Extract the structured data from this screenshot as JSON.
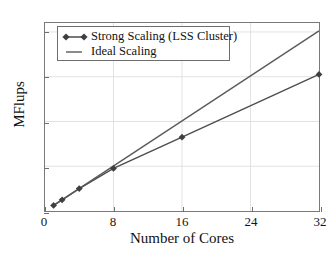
{
  "chart_data": {
    "type": "line",
    "title": "",
    "xlabel": "Number of Cores",
    "ylabel": "MFlups",
    "xlim": [
      0,
      32
    ],
    "ylim": [
      0,
      84
    ],
    "xticks": [
      0,
      8,
      16,
      24,
      32
    ],
    "yticks": [
      0,
      20,
      40,
      60,
      80
    ],
    "xtick_labels": [
      "0",
      "8",
      "16",
      "24",
      "32"
    ],
    "ytick_labels": [
      "0",
      "20",
      "40",
      "60",
      "80"
    ],
    "grid": true,
    "legend_position": "upper left",
    "series": [
      {
        "name": "Strong Scaling (LSS Cluster)",
        "marker": "diamond",
        "color": "#4d4d4d",
        "x": [
          1,
          2,
          4,
          8,
          16,
          32
        ],
        "values": [
          2.5,
          5.0,
          10.0,
          19.0,
          33.0,
          61.0
        ]
      },
      {
        "name": "Ideal Scaling",
        "marker": "none",
        "color": "#5a5a5a",
        "x": [
          1,
          32
        ],
        "values": [
          2.5,
          80.5
        ]
      }
    ]
  },
  "legend": {
    "items": [
      {
        "label": "Strong Scaling (LSS Cluster)"
      },
      {
        "label": "Ideal Scaling"
      }
    ]
  },
  "axes": {
    "x_title": "Number of Cores",
    "y_title": "MFlups"
  }
}
